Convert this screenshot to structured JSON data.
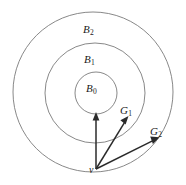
{
  "figure": {
    "kind": "concentric-balls-with-vectors-diagram",
    "background_color": "#ffffff",
    "circle_stroke_color": "#7a7a7a",
    "arrow_color": "#2b2b2b",
    "label_color": "#1a1a1a",
    "labels": {
      "b2": {
        "base": "B",
        "sub": "2"
      },
      "b1": {
        "base": "B",
        "sub": "1"
      },
      "b0": {
        "base": "B",
        "sub": "0"
      },
      "g1": {
        "base": "G",
        "sub": "1"
      },
      "g2": {
        "base": "G",
        "sub": "2"
      },
      "v": {
        "base": "v",
        "sub": ""
      }
    },
    "circles": [
      {
        "name": "B2",
        "cx": 93,
        "cy": 92,
        "r": 80
      },
      {
        "name": "B1",
        "cx": 95,
        "cy": 93,
        "r": 50
      },
      {
        "name": "B0",
        "cx": 96,
        "cy": 93,
        "r": 21
      }
    ],
    "vectors": [
      {
        "name": "v-to-B0",
        "x1": 96,
        "y1": 169,
        "x2": 96,
        "y2": 114
      },
      {
        "name": "v-to-G1",
        "x1": 96,
        "y1": 169,
        "x2": 128,
        "y2": 117
      },
      {
        "name": "v-to-G2",
        "x1": 96,
        "y1": 169,
        "x2": 158,
        "y2": 138
      }
    ],
    "origin_point": {
      "name": "v",
      "x": 96,
      "y": 169
    }
  }
}
